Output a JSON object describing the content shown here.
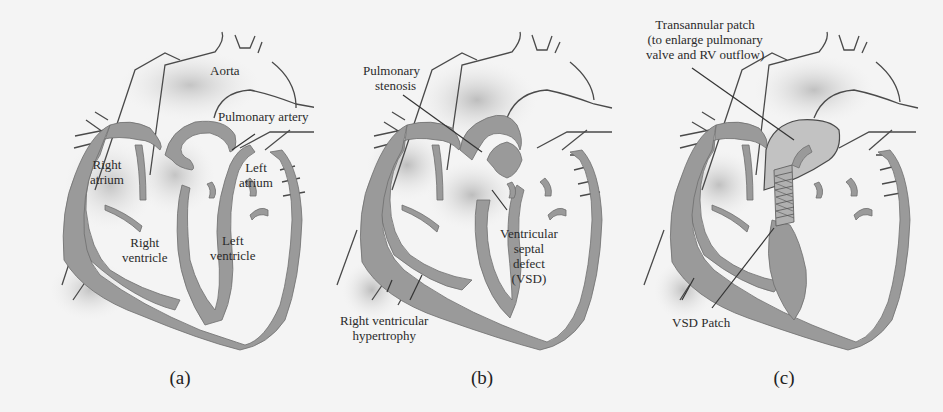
{
  "figure": {
    "colors": {
      "background": "#f4f4f4",
      "muscle_wall": "#9a9a9a",
      "shading": "#c8c8c8",
      "text": "#2b2b2b"
    },
    "panels": [
      {
        "id": "a",
        "caption": "(a)",
        "labels": {
          "aorta": "Aorta",
          "pulmonary_artery": "Pulmonary artery",
          "right_atrium_1": "Right",
          "right_atrium_2": "atrium",
          "left_atrium_1": "Left",
          "left_atrium_2": "atrium",
          "right_ventricle_1": "Right",
          "right_ventricle_2": "ventricle",
          "left_ventricle_1": "Left",
          "left_ventricle_2": "ventricle"
        }
      },
      {
        "id": "b",
        "caption": "(b)",
        "labels": {
          "pulmonary_stenosis_1": "Pulmonary",
          "pulmonary_stenosis_2": "stenosis",
          "vsd_1": "Ventricular",
          "vsd_2": "septal",
          "vsd_3": "defect",
          "vsd_4": "(VSD)",
          "rvh_1": "Right ventricular",
          "rvh_2": "hypertrophy"
        }
      },
      {
        "id": "c",
        "caption": "(c)",
        "labels": {
          "transannular_1": "Transannular patch",
          "transannular_2": "(to enlarge pulmonary",
          "transannular_3": "valve and RV outflow)",
          "vsd_patch": "VSD Patch"
        }
      }
    ]
  }
}
